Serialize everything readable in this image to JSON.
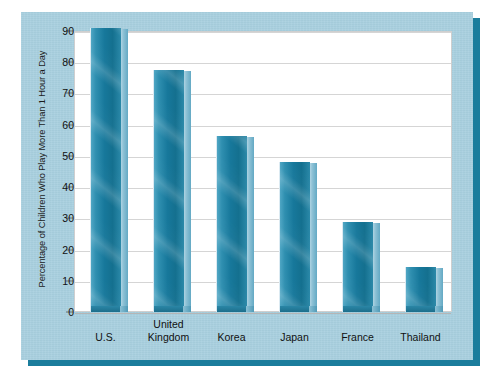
{
  "chart_data": {
    "type": "bar",
    "title": "",
    "subtitle": "",
    "xlabel": "",
    "ylabel": "Percentage of Children Who Play More Than 1 Hour a Day",
    "categories": [
      "U.S.",
      "United Kingdom",
      "Korea",
      "Japan",
      "France",
      "Thailand"
    ],
    "category_lines": [
      [
        "U.S."
      ],
      [
        "United",
        "Kingdom"
      ],
      [
        "Korea"
      ],
      [
        "Japan"
      ],
      [
        "France"
      ],
      [
        "Thailand"
      ]
    ],
    "values": [
      89,
      75.5,
      54.5,
      46,
      27,
      12.5
    ],
    "ylim": [
      0,
      90
    ],
    "ytick_labels": [
      "90",
      "80",
      "70",
      "60",
      "50",
      "40",
      "30",
      "20",
      "10",
      "0"
    ],
    "ytick_values": [
      90,
      80,
      70,
      60,
      50,
      40,
      30,
      20,
      10,
      0
    ],
    "ytick_step": 10,
    "grid": true,
    "grid_axis": "y",
    "legend": "none",
    "bar_style": "3d",
    "colors": {
      "bar_face": "#17789b",
      "bar_highlight": "#4fa6c4",
      "bar_side": "#8fc2d6",
      "panel_background": "#a8cfdf",
      "panel_shadow": "#1b7d9c",
      "plot_background": "#ffffff",
      "gridline": "#d5d5d5",
      "text": "#111111"
    }
  }
}
